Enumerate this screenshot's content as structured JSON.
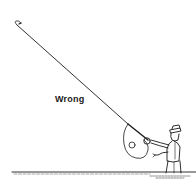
{
  "figure": {
    "caption_label": "Wrong",
    "colors": {
      "ink": "#1a1a1a",
      "background": "#ffffff"
    }
  }
}
